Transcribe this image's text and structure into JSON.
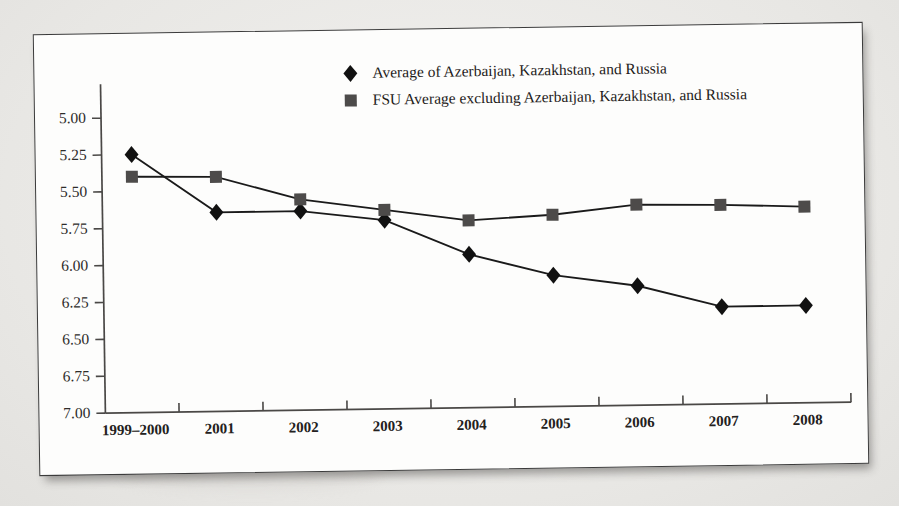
{
  "chart_data": {
    "type": "line",
    "title": "",
    "subtitle": "",
    "xlabel": "",
    "ylabel": "",
    "inverted_y_axis": true,
    "grid": false,
    "legend_position": "top-center",
    "categories": [
      "1999–2000",
      "2001",
      "2002",
      "2003",
      "2004",
      "2005",
      "2006",
      "2007",
      "2008"
    ],
    "ylim": [
      5.0,
      7.0
    ],
    "ytick_labels": [
      "5.00",
      "5.25",
      "5.50",
      "5.75",
      "6.00",
      "6.25",
      "6.50",
      "6.75",
      "7.00"
    ],
    "ytick_values": [
      5.0,
      5.25,
      5.5,
      5.75,
      6.0,
      6.25,
      6.5,
      6.75,
      7.0
    ],
    "series": [
      {
        "name": "Average of Azerbaijan, Kazakhstan, and Russia",
        "marker": "diamond",
        "color": "#111111",
        "values": [
          5.25,
          5.65,
          5.65,
          5.72,
          5.96,
          6.11,
          6.19,
          6.34,
          6.34
        ]
      },
      {
        "name": "FSU Average excluding Azerbaijan, Kazakhstan, and Russia",
        "marker": "square",
        "color": "#4d4b4a",
        "values": [
          5.4,
          5.41,
          5.57,
          5.65,
          5.73,
          5.7,
          5.64,
          5.65,
          5.67
        ]
      }
    ]
  },
  "legend": {
    "items": [
      {
        "label": "Average of Azerbaijan, Kazakhstan, and Russia",
        "marker": "diamond-marker-icon"
      },
      {
        "label": "FSU Average excluding Azerbaijan, Kazakhstan, and Russia",
        "marker": "square-marker-icon"
      }
    ]
  },
  "colors": {
    "page_background": "#e9e8e6",
    "figure_background": "#fdfdfc",
    "axis": "#4a4846",
    "series_1": "#111111",
    "series_2": "#4d4b4a"
  }
}
